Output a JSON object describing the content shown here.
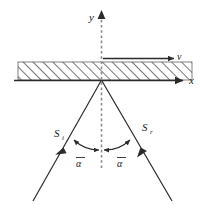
{
  "figure": {
    "background_color": "#ffffff",
    "line_color": "#2b2b2b",
    "dashed_color": "#8a8a8a",
    "hatch_color": "#4a4a4a"
  },
  "axes": {
    "y_label": "y",
    "x_label": "x",
    "origin_note": "origin at intersection of x-axis and dashed normal"
  },
  "velocity": {
    "label": "v",
    "direction": "right"
  },
  "rays": {
    "incident": {
      "label": "S",
      "subscript": "i",
      "direction": "toward-origin"
    },
    "reflected": {
      "label": "S",
      "subscript": "r",
      "direction": "away-from-origin"
    }
  },
  "angles": {
    "left": "α",
    "right": "α",
    "overbar": true,
    "left_name": "alpha-bar-left",
    "right_name": "alpha-bar-right"
  },
  "medium": {
    "fill_style": "diagonal-hatch",
    "description": "hatched slab above the x-axis"
  }
}
